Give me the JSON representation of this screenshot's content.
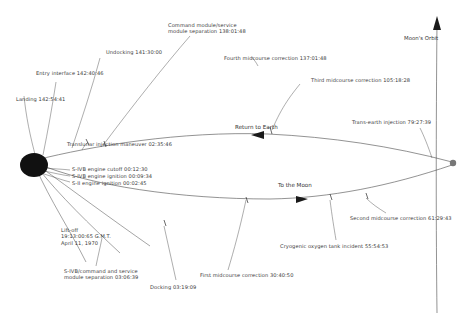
{
  "diagram": {
    "bodies": {
      "earth_name": "Earth",
      "moon_name": "Moon",
      "moon_orbit_label": "Moon's Orbit"
    },
    "flow_labels": [
      {
        "text": "To the Moon"
      },
      {
        "text": "Return to Earth"
      }
    ],
    "events": [
      {
        "id": "liftoff",
        "text": "Lift-off\n19:13:00:65 G.M.T.\nApril 11, 1970"
      },
      {
        "id": "s2-ignition",
        "text": "S-II engine ignition 00:02:45"
      },
      {
        "id": "s4b-ignition",
        "text": "S-IVB engine ignition 00:09:34"
      },
      {
        "id": "s4b-cutoff",
        "text": "S-IVB engine cutoff 00:12:30"
      },
      {
        "id": "tli",
        "text": "Translunar injection maneuver 02:35:46"
      },
      {
        "id": "s4b-csm-separation",
        "text": "S-IVB/command and service\nmodule separation 03:06:39"
      },
      {
        "id": "docking",
        "text": "Docking 03:19:09"
      },
      {
        "id": "midcourse-1",
        "text": "First midcourse correction 30:40:50"
      },
      {
        "id": "oxygen-tank-incident",
        "text": "Cryogenic oxygen tank incident 55:54:53"
      },
      {
        "id": "midcourse-2",
        "text": "Second midcourse correction 61:29:43"
      },
      {
        "id": "trans-earth-injection",
        "text": "Trans-earth injection 79:27:39"
      },
      {
        "id": "midcourse-3",
        "text": "Third midcourse correction 105:18:28"
      },
      {
        "id": "midcourse-4",
        "text": "Fourth midcourse correction 137:01:48"
      },
      {
        "id": "cm-sm-separation",
        "text": "Command module/service\nmodule separation 138:01:48"
      },
      {
        "id": "undocking",
        "text": "Undocking 141:30:00"
      },
      {
        "id": "entry-interface",
        "text": "Entry interface 142:40:46"
      },
      {
        "id": "landing",
        "text": "Landing 142:54:41"
      }
    ],
    "colors": {
      "line": "#4a4a4a",
      "text": "#3a3a3a",
      "earth": "#111111",
      "background": "#ffffff"
    }
  }
}
